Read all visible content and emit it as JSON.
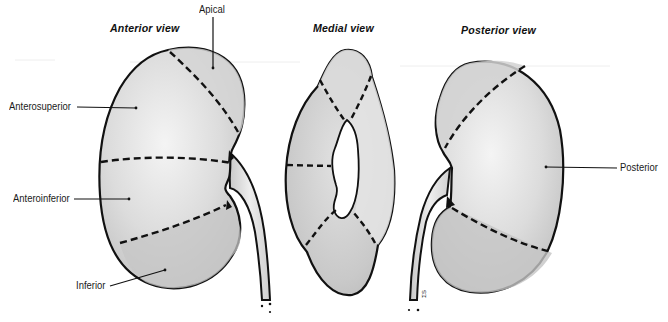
{
  "figure": {
    "views": [
      {
        "id": "anterior",
        "title": "Anterior view"
      },
      {
        "id": "medial",
        "title": "Medial view"
      },
      {
        "id": "posterior",
        "title": "Posterior view"
      }
    ],
    "segment_labels": {
      "apical": "Apical",
      "anterosuperior": "Anterosuperior",
      "anteroinferior": "Anteroinferior",
      "inferior": "Inferior",
      "posterior": "Posterior"
    },
    "artist_initials": "ΣS"
  },
  "colors": {
    "outline": "#111111",
    "fill_light": "#e6e6e6",
    "fill_mid": "#cfcfcf",
    "fill_dark": "#bdbdbd",
    "background": "#ffffff"
  }
}
